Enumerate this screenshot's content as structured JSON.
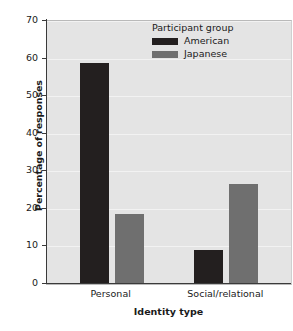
{
  "chart_data": {
    "type": "bar",
    "title": "",
    "xlabel": "Identity type",
    "ylabel": "Percentage of responses",
    "categories": [
      "Personal",
      "Social/relational"
    ],
    "series": [
      {
        "name": "American",
        "values": [
          58.8,
          9.0
        ],
        "color": "#231f1f"
      },
      {
        "name": "Japanese",
        "values": [
          18.7,
          26.5
        ],
        "color": "#6f6f6f"
      }
    ],
    "ylim": [
      0,
      70
    ],
    "yticks": [
      0,
      10,
      20,
      30,
      40,
      50,
      60,
      70
    ],
    "ytick_labels": [
      "0",
      "10",
      "20",
      "30",
      "40",
      "50",
      "60",
      "70"
    ],
    "grid": true,
    "legend": {
      "title": "Participant group",
      "position": "top-right",
      "entries": [
        "American",
        "Japanese"
      ]
    },
    "plot_background": "#e4e4e4",
    "figure_background": "#ffffff"
  }
}
